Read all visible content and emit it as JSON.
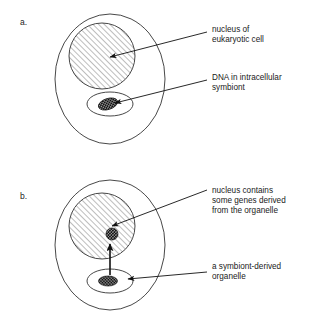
{
  "figure": {
    "type": "scientific-diagram",
    "background_color": "#ffffff",
    "line_color": "#333333"
  },
  "panels": [
    {
      "id": "a",
      "letter": "a.",
      "shapes": {
        "cell_label": "eukaryotic cell outline",
        "nucleus_label": "hatched nucleus",
        "symbiont_label": "intracellular symbiont"
      },
      "callouts": [
        {
          "name": "nucleus-callout",
          "lines": [
            "nucleus of",
            "eukaryotic cell"
          ]
        },
        {
          "name": "symbiont-dna-callout",
          "lines": [
            "DNA in intracellular",
            "symbiont"
          ]
        }
      ]
    },
    {
      "id": "b",
      "letter": "b.",
      "shapes": {
        "cell_label": "eukaryotic cell outline",
        "nucleus_label": "hatched nucleus with transferred gene",
        "symbiont_label": "symbiont-derived organelle",
        "arrow_label": "gene transfer arrow"
      },
      "callouts": [
        {
          "name": "nucleus-genes-callout",
          "lines": [
            "nucleus contains",
            "some genes derived",
            "from the organelle"
          ]
        },
        {
          "name": "organelle-callout",
          "lines": [
            "a symbiont-derived",
            "organelle"
          ]
        }
      ]
    }
  ]
}
